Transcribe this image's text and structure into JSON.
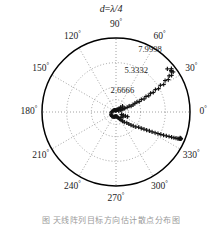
{
  "figure": {
    "title": "d=λ/4",
    "title_parts": {
      "variable": "d",
      "operator": "=",
      "value": "λ/4"
    },
    "caption_fragment": "图  天线阵列目标方向估计散点分布图"
  },
  "axes": {
    "angle_unit": "°",
    "angle_ticks": [
      {
        "value": 0,
        "label": "0"
      },
      {
        "value": 30,
        "label": "30"
      },
      {
        "value": 60,
        "label": "60"
      },
      {
        "value": 90,
        "label": "90"
      },
      {
        "value": 120,
        "label": "120"
      },
      {
        "value": 150,
        "label": "150"
      },
      {
        "value": 180,
        "label": "180"
      },
      {
        "value": 210,
        "label": "210"
      },
      {
        "value": 240,
        "label": "240"
      },
      {
        "value": 270,
        "label": "270"
      },
      {
        "value": 300,
        "label": "300"
      },
      {
        "value": 330,
        "label": "330"
      }
    ],
    "radial_ticks": [
      {
        "value": 2.6666,
        "label": "2.6666"
      },
      {
        "value": 5.3332,
        "label": "5.3332"
      },
      {
        "value": 7.9998,
        "label": "7.9998"
      }
    ],
    "rmax": 7.9998,
    "grid": true,
    "grid_color": "#8c8c8c",
    "outer_color": "#000000"
  },
  "chart_data": {
    "type": "scatter",
    "projection": "polar",
    "title": "d=λ/4",
    "xlabel": "",
    "ylabel": "",
    "rlim": [
      0,
      7.9998
    ],
    "theta_unit": "degrees",
    "grid": true,
    "legend": null,
    "marker": "plus",
    "marker_color": "#111111",
    "series": [
      {
        "name": "DOA estimates",
        "theta": [
          21.0,
          21.8,
          22.6,
          23.4,
          22.0,
          24.0,
          23.0,
          21.5,
          22.8,
          24.6,
          23.8,
          25.2,
          24.2,
          26.0,
          25.0,
          27.2,
          26.4,
          28.4,
          27.6,
          29.6,
          28.8,
          31.0,
          30.0,
          32.6,
          31.8,
          34.2,
          33.4,
          36.0,
          35.0,
          38.0,
          37.0,
          40.0,
          42.0,
          45.0,
          48.0,
          52.0,
          58.0,
          64.0,
          70.0,
          78.0,
          86.0,
          95.0,
          104.0,
          112.0,
          120.0,
          132.0,
          145.0,
          160.0,
          175.0,
          190.0,
          205.0,
          218.0,
          228.0,
          238.0,
          246.0,
          252.0,
          258.0,
          264.0,
          270.0,
          276.0,
          282.0,
          288.0,
          294.0,
          298.0,
          302.0,
          306.0,
          309.0,
          312.0,
          315.0,
          317.0,
          319.0,
          321.0,
          323.0,
          324.5,
          326.0,
          327.2,
          328.4,
          329.4,
          330.4,
          331.2,
          332.0,
          332.8,
          333.4,
          334.0,
          334.6,
          335.2,
          335.6,
          336.0,
          336.4,
          336.8,
          337.0,
          337.2,
          337.4,
          337.6,
          337.8,
          338.0,
          338.0,
          337.6,
          337.0,
          336.2
        ],
        "r": [
          0.32,
          0.55,
          0.8,
          1.05,
          1.3,
          1.55,
          0.95,
          1.75,
          2.0,
          2.25,
          0.62,
          2.5,
          2.75,
          3.05,
          3.35,
          3.65,
          3.95,
          4.25,
          4.55,
          4.9,
          5.25,
          5.6,
          5.95,
          6.3,
          6.65,
          6.95,
          7.2,
          7.4,
          7.55,
          7.6,
          7.45,
          7.25,
          0.95,
          0.7,
          0.5,
          0.38,
          0.3,
          0.26,
          0.24,
          0.22,
          0.21,
          0.2,
          0.2,
          0.21,
          0.23,
          0.26,
          0.3,
          0.36,
          0.44,
          0.52,
          0.58,
          0.62,
          0.64,
          0.62,
          0.58,
          0.54,
          0.5,
          0.48,
          0.46,
          0.48,
          0.52,
          0.6,
          0.72,
          0.88,
          1.05,
          1.22,
          1.42,
          0.78,
          1.65,
          1.9,
          2.15,
          2.4,
          2.68,
          0.92,
          2.95,
          3.25,
          3.55,
          3.85,
          4.15,
          4.45,
          4.78,
          5.1,
          5.42,
          5.72,
          6.02,
          6.32,
          6.6,
          6.85,
          7.08,
          7.28,
          7.42,
          7.52,
          7.58,
          7.6,
          7.56,
          7.48,
          1.35,
          1.1,
          0.85,
          0.66
        ]
      }
    ]
  }
}
